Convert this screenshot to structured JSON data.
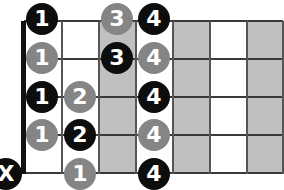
{
  "diagram": {
    "type": "guitar-fretboard-scale-pattern",
    "colors": {
      "shade": "#c0c0c0",
      "white": "#ffffff",
      "line": "#3a3a3a",
      "nut": "#111111",
      "dot_black": "#0d0d0d",
      "dot_gray": "#858585"
    },
    "frets": 7,
    "shaded_frets": [
      3,
      5,
      7
    ],
    "strings": 5,
    "notes": [
      {
        "string": 1,
        "fret": 1,
        "label": "1",
        "style": "black"
      },
      {
        "string": 1,
        "fret": 3,
        "label": "3",
        "style": "gray"
      },
      {
        "string": 1,
        "fret": 4,
        "label": "4",
        "style": "black"
      },
      {
        "string": 2,
        "fret": 1,
        "label": "1",
        "style": "gray"
      },
      {
        "string": 2,
        "fret": 3,
        "label": "3",
        "style": "black"
      },
      {
        "string": 2,
        "fret": 4,
        "label": "4",
        "style": "gray"
      },
      {
        "string": 3,
        "fret": 1,
        "label": "1",
        "style": "black"
      },
      {
        "string": 3,
        "fret": 2,
        "label": "2",
        "style": "gray"
      },
      {
        "string": 3,
        "fret": 4,
        "label": "4",
        "style": "black"
      },
      {
        "string": 4,
        "fret": 1,
        "label": "1",
        "style": "gray"
      },
      {
        "string": 4,
        "fret": 2,
        "label": "2",
        "style": "black"
      },
      {
        "string": 4,
        "fret": 4,
        "label": "4",
        "style": "gray"
      },
      {
        "string": 5,
        "fret": 0,
        "label": "X",
        "style": "black"
      },
      {
        "string": 5,
        "fret": 2,
        "label": "1",
        "style": "gray"
      },
      {
        "string": 5,
        "fret": 4,
        "label": "4",
        "style": "black"
      }
    ]
  }
}
